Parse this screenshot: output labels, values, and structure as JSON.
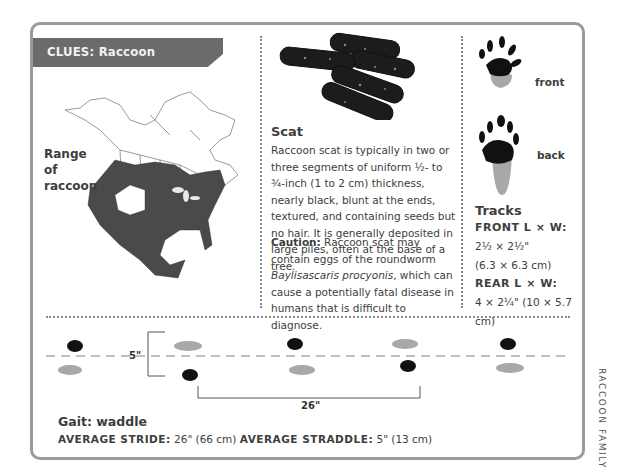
{
  "header": {
    "title": "CLUES: Raccoon"
  },
  "map": {
    "label": "Range of raccoon",
    "range_color": "#4a4a4a"
  },
  "scat": {
    "title": "Scat",
    "description": "Raccoon scat is typically in two or three segments of uniform ½- to ¾-inch (1 to 2 cm) thickness, nearly black, blunt at the ends, textured, and containing seeds but no hair. It is generally deposited in large piles, often at the base of a tree.",
    "caution_label": "Caution:",
    "caution_text_before": " Raccoon scat may contain eggs of the roundworm ",
    "caution_species": "Baylisascaris procyonis",
    "caution_text_after": ", which can cause a potentially fatal disease in humans that is difficult to diagnose."
  },
  "tracks": {
    "front_label": "front",
    "back_label": "back",
    "title": "Tracks",
    "front_heading": "FRONT L × W:",
    "front_in": "2½ × 2½\"",
    "front_cm": "(6.3 × 6.3 cm)",
    "rear_heading": "REAR L × W:",
    "rear_value": "4 × 2¼\" (10 × 5.7 cm)"
  },
  "trail": {
    "straddle_label": "5\"",
    "stride_label": "26\""
  },
  "gait": {
    "title": "Gait: waddle",
    "stride_label": "AVERAGE STRIDE:",
    "stride_value": " 26\" (66 cm) ",
    "straddle_label": "AVERAGE STRADDLE:",
    "straddle_value": " 5\" (13 cm)"
  },
  "side_label": "RACCOON FAMILY",
  "colors": {
    "banner": "#6b6b6b",
    "border": "#9a9a9a",
    "dark_track": "#111111",
    "light_track": "#a8a8a8"
  }
}
